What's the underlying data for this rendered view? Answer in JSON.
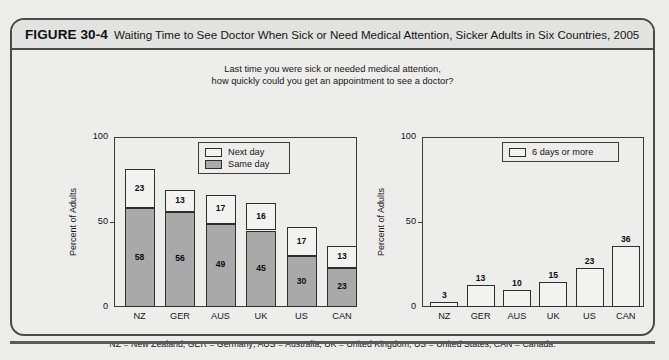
{
  "figure": {
    "number": "FIGURE 30-4",
    "title": "Waiting Time to See Doctor When Sick or Need Medical Attention, Sicker Adults in Six Countries, 2005",
    "subtitle_line1": "Last time you were sick or needed medical attention,",
    "subtitle_line2": "how quickly could you get an appointment to see a doctor?",
    "footnote": "NZ = New Zealand; GER = Germany; AUS = Australia; UK = United Kingdom; US = United States; CAN = Canada."
  },
  "colors": {
    "same_day": "#a9a9a9",
    "next_day": "#f2f2f1",
    "six_days": "#f2f2f1",
    "frame": "#3c3c3c",
    "panel_bg": "#ededec"
  },
  "chart_data": [
    {
      "type": "bar",
      "id": "left",
      "stacked": true,
      "title": "",
      "xlabel": "",
      "ylabel": "Percent of Adults",
      "ylim": [
        0,
        100
      ],
      "yticks": [
        0,
        50,
        100
      ],
      "ytick_labels": [
        "0",
        "50",
        "100"
      ],
      "grid": false,
      "legend_position": "top-right",
      "categories": [
        "NZ",
        "GER",
        "AUS",
        "UK",
        "US",
        "CAN"
      ],
      "series": [
        {
          "name": "Same day",
          "values": [
            58,
            56,
            49,
            45,
            30,
            23
          ]
        },
        {
          "name": "Next day",
          "values": [
            23,
            13,
            17,
            16,
            17,
            13
          ]
        }
      ],
      "totals": [
        81,
        69,
        66,
        61,
        47,
        36
      ]
    },
    {
      "type": "bar",
      "id": "right",
      "stacked": false,
      "title": "",
      "xlabel": "",
      "ylabel": "Percent of Adults",
      "ylim": [
        0,
        100
      ],
      "yticks": [
        0,
        50,
        100
      ],
      "ytick_labels": [
        "0",
        "50",
        "100"
      ],
      "grid": false,
      "legend_position": "top-right",
      "categories": [
        "NZ",
        "GER",
        "AUS",
        "UK",
        "US",
        "CAN"
      ],
      "series": [
        {
          "name": "6 days or more",
          "values": [
            3,
            13,
            10,
            15,
            23,
            36
          ]
        }
      ]
    }
  ]
}
